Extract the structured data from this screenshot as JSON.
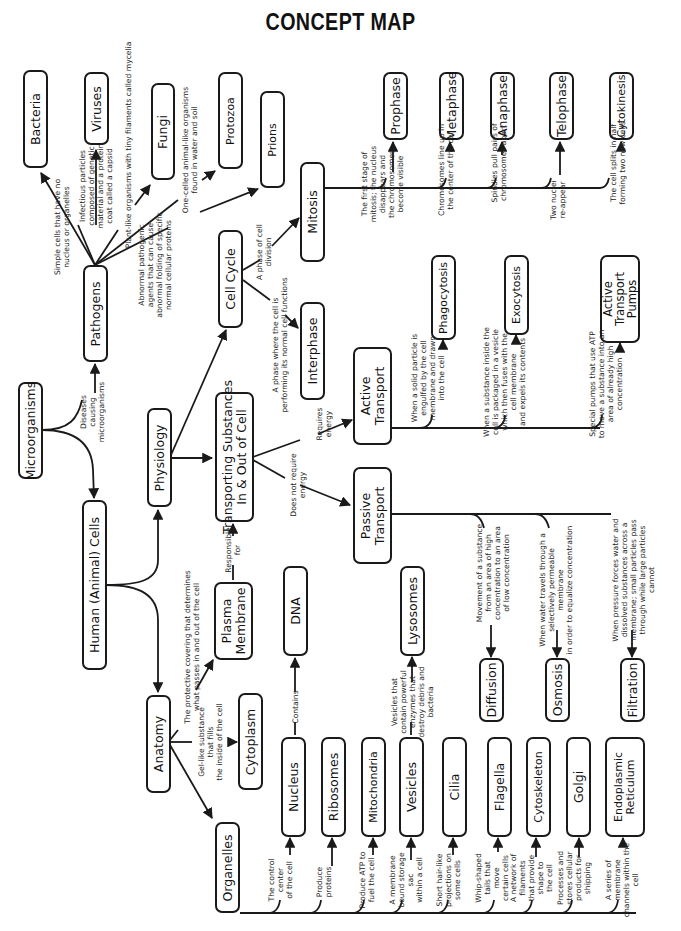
{
  "title": "CONCEPT MAP",
  "nodes": {
    "microorganisms": "Microorganisms",
    "pathogens": "Pathogens",
    "bacteria": "Bacteria",
    "viruses": "Viruses",
    "fungi": "Fungi",
    "protozoa": "Protozoa",
    "prions": "Prions",
    "human_cells": "Human (Animal) Cells",
    "physiology": "Physiology",
    "anatomy": "Anatomy",
    "organelles": "Organelles",
    "cell_cycle": "Cell Cycle",
    "interphase": "Interphase",
    "mitosis": "Mitosis",
    "prophase": "Prophase",
    "metaphase": "Metaphase",
    "anaphase": "Anaphase",
    "telophase": "Telophase",
    "cytokinesis": "Cytokinesis",
    "transporting": "Transporting Substances\nIn & Out of Cell",
    "active_transport": "Active\nTransport",
    "passive_transport": "Passive\nTransport",
    "phagocytosis": "Phagocytosis",
    "exocytosis": "Exocytosis",
    "active_transport_pumps": "Active\nTransport\nPumps",
    "diffusion": "Diffusion",
    "osmosis": "Osmosis",
    "filtration": "Filtration",
    "plasma_membrane": "Plasma\nMembrane",
    "cytoplasm": "Cytoplasm",
    "dna": "DNA",
    "lysosomes": "Lysosomes",
    "nucleus": "Nucleus",
    "ribosomes": "Ribosomes",
    "mitochondria": "Mitochondria",
    "vesicles": "Vesicles",
    "cilia": "Cilia",
    "flagella": "Flagella",
    "cytoskeleton": "Cytoskeleton",
    "golgi": "Golgi",
    "endoplasmic_reticulum": "Endoplasmic\nReticulum"
  },
  "notes": {
    "diseases": "Diseases\ncausing\nmicroorganisms",
    "bacteria": "Simple cells that have no\nnucleus or organelles",
    "viruses": "Infectious particles\ncomposed of genetic\nmaterial and a protein\ncoat called a capsid",
    "fungi": "Plant-like organisms with tiny filaments called mycelia",
    "protozoa": "One-celled animal-like organisms\nfound in water and soil",
    "prions": "Abnormal pathogenic\nagents that can cause\nabnormal folding of specific\nnormal cellular proteins",
    "cell_division": "A phase of cell\ndivision",
    "interphase": "A phase where the cell is\nperforming its normal cell functions",
    "prophase": "The first stage of\nmitosis; the nucleus\ndisappears and\nthe chromosomes\nbecome visible",
    "metaphase": "Chromosomes line up in\nthe center of the cell",
    "anaphase": "Spindles pull pairs of\nchromosomes apart",
    "telophase": "Two nuclei\nre-appear",
    "cytokinesis": "The cell splits in half\nforming two new cells",
    "requires_energy": "Requires\nenergy",
    "no_energy": "Does not require\nenergy",
    "phagocytosis": "When a solid particle is\nengulfed by the cell\nmembrane and drawn\ninto the cell",
    "exocytosis": "When a substance inside the\ncell is packaged in a vesicle\nwhich then fuses with the\ncell membrane\nand expels its contents",
    "pumps": "Special pumps that use ATP\nto move a substance into an\narea of already high\nconcentration",
    "diffusion": "Movement of a substance\nfrom an area of high\nconcentration to an area\nof low concentration",
    "osmosis": "When water travels through a\nselectively permeable\nmembrane\nin order to equalize concentration",
    "filtration": "When pressure forces water and\ndissolved substances across a\nmembrane; small particles pass\nthrough while large particles\ncannot",
    "responsible_for": "Responsible\nfor",
    "plasma_membrane": "The protective covering that determines\nwhat passes in and out of the cell",
    "cytoplasm": "Gel-like substance\nthat fills\nthe inside of the cell",
    "contains": "Contains",
    "lysosomes": "Vesicles that\ncontain powerful\nenzymes that\ndestroy debris and\nbacteria",
    "nucleus": "The control\ncenter\nof the cell",
    "ribosomes": "Produce\nproteins",
    "mitochondria": "Produce ATP to\nfuel the cell",
    "vesicles": "A membrane\nbound storage\nsac\nwithin a cell",
    "cilia": "Short hair-like\nprojections on\nsome cells",
    "flagella": "Whip-shaped\ntails that\nmove\ncertain cells",
    "cytoskeleton": "A network of\nfilaments\nthat provide\nshape to\nthe cell",
    "golgi": "Processes and\nstores cellular\nproducts for\nshipping",
    "er": "A series of\nmembrane\nchannels within the\ncell"
  },
  "colors": {
    "ink": "#1a1a1a",
    "background": "#ffffff"
  }
}
